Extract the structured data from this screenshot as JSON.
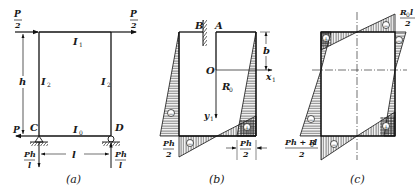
{
  "figure": {
    "panels": [
      {
        "id": "a",
        "caption": "(a)",
        "labels": {
          "load_top_left_num": "P",
          "load_top_left_den": "2",
          "load_top_right_num": "P",
          "load_top_right_den": "2",
          "load_bottom_left": "P",
          "beam_top": "I",
          "beam_top_sub": "1",
          "column_left": "I",
          "column_left_sub": "2",
          "column_right": "I",
          "column_right_sub": "2",
          "beam_bottom": "I",
          "beam_bottom_sub": "0",
          "height": "h",
          "span": "l",
          "node_c": "C",
          "node_d": "D",
          "reaction_left_num": "Ph",
          "reaction_left_den": "l",
          "reaction_right_num": "Ph",
          "reaction_right_den": "l"
        }
      },
      {
        "id": "b",
        "caption": "(b)",
        "labels": {
          "node_b": "B",
          "node_a": "A",
          "origin": "O",
          "axis_x": "x",
          "axis_x_sub": "1",
          "axis_y": "y",
          "axis_y_sub": "1",
          "redundant": "R",
          "redundant_sub": "0",
          "dim_b": "b",
          "moment_left_num": "Ph",
          "moment_left_den": "2",
          "moment_right_num": "Ph",
          "moment_right_den": "2",
          "sign_neg": "−",
          "sign_pos": "+"
        }
      },
      {
        "id": "c",
        "caption": "(c)",
        "labels": {
          "moment_top_num": "R",
          "moment_top_num_sub": "0",
          "moment_top_num_tail": "l",
          "moment_top_den": "2",
          "moment_bottom_num": "Ph + R",
          "moment_bottom_num_sub": "0",
          "moment_bottom_num_tail": "l",
          "moment_bottom_den": "2",
          "sign_neg": "−",
          "sign_pos": "+"
        }
      }
    ]
  }
}
